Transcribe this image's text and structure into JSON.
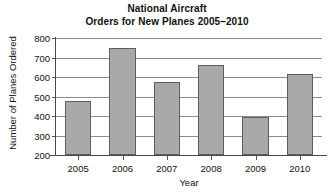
{
  "chart_data": {
    "type": "bar",
    "title_lines": [
      "National Aircraft",
      "Orders for New Planes 2005–2010"
    ],
    "xlabel": "Year",
    "ylabel": "Number of Planes Ordered",
    "categories": [
      "2005",
      "2006",
      "2007",
      "2008",
      "2009",
      "2010"
    ],
    "values": [
      475,
      750,
      575,
      660,
      395,
      615
    ],
    "ylim": [
      200,
      800
    ],
    "ytick_values": [
      200,
      300,
      400,
      500,
      600,
      700,
      800
    ],
    "ytick_labels": [
      "200",
      "300",
      "400",
      "500",
      "600",
      "700",
      "800"
    ],
    "grid": true,
    "grid_axis": "y",
    "legend": false,
    "bar_color": "#a9a9a9",
    "bar_edge_color": "#5e5e5e",
    "gridline_color": "#8c8c8c",
    "axis_color": "#4a4a4a",
    "background_color": "#ffffff",
    "text_color": "#111111"
  }
}
